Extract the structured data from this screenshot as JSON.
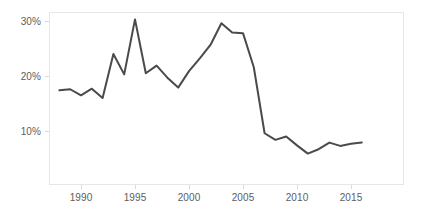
{
  "chart_data": {
    "type": "line",
    "title": "",
    "subtitle": "",
    "xlabel": "",
    "ylabel": "",
    "xlim": [
      1987.2,
      1987.2
    ],
    "ylim": [
      0,
      33.5
    ],
    "grid": false,
    "legend": null,
    "line_color": "#4a4a4a",
    "background_color": "#ffffff",
    "frame_color": "#e6e6e6",
    "tick_label_color": "#5c5c5c",
    "y_ticks": [
      {
        "value": 10,
        "label": "10%"
      },
      {
        "value": 20,
        "label": "20%"
      },
      {
        "value": 30,
        "label": "30%"
      }
    ],
    "x_ticks": [
      {
        "value": 1990,
        "label": "1990"
      },
      {
        "value": 1995,
        "label": "1995"
      },
      {
        "value": 2000,
        "label": "2000"
      },
      {
        "value": 2005,
        "label": "2005"
      },
      {
        "value": 2010,
        "label": "2010"
      },
      {
        "value": 2015,
        "label": "2015"
      }
    ],
    "x": [
      1988,
      1989,
      1990,
      1991,
      1992,
      1993,
      1994,
      1995,
      1996,
      1997,
      1998,
      1999,
      2000,
      2001,
      2002,
      2003,
      2004,
      2005,
      2006,
      2007,
      2008,
      2009,
      2010,
      2011,
      2012,
      2013,
      2014,
      2015,
      2016
    ],
    "values": [
      17.3,
      17.5,
      16.4,
      17.6,
      15.9,
      23.9,
      20.2,
      30.2,
      20.4,
      21.8,
      19.6,
      17.8,
      20.8,
      23.1,
      25.6,
      29.5,
      27.8,
      27.7,
      21.5,
      9.5,
      8.3,
      8.9,
      7.3,
      5.8,
      6.6,
      7.8,
      7.2,
      7.6,
      7.8
    ],
    "series_name": "value"
  }
}
